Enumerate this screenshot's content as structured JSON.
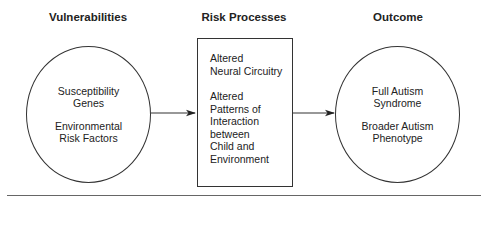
{
  "headings": {
    "vulnerabilities": "Vulnerabilities",
    "risk_processes": "Risk Processes",
    "outcome": "Outcome"
  },
  "vulnerabilities_node": {
    "groups": [
      {
        "lines": [
          "Susceptibility",
          "Genes"
        ]
      },
      {
        "lines": [
          "Environmental",
          "Risk Factors"
        ]
      }
    ]
  },
  "risk_processes_node": {
    "groups": [
      {
        "lines": [
          "Altered",
          "Neural Circuitry"
        ]
      },
      {
        "lines": [
          "Altered",
          "Patterns of",
          "Interaction",
          "between",
          "Child and",
          "Environment"
        ]
      }
    ]
  },
  "outcome_node": {
    "groups": [
      {
        "lines": [
          "Full Autism",
          "Syndrome"
        ]
      },
      {
        "lines": [
          "Broader Autism",
          "Phenotype"
        ]
      }
    ]
  },
  "edges": [
    {
      "from": "Vulnerabilities",
      "to": "Risk Processes"
    },
    {
      "from": "Risk Processes",
      "to": "Outcome"
    }
  ],
  "colors": {
    "stroke": "#333333",
    "rule": "#666666",
    "text": "#222222"
  }
}
